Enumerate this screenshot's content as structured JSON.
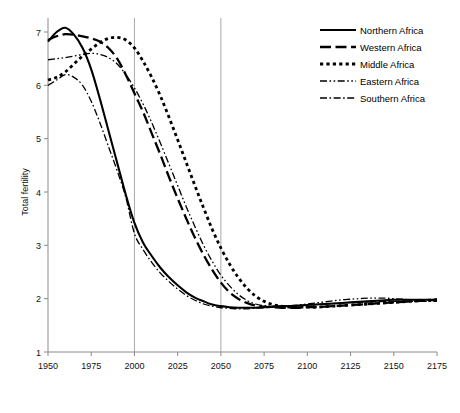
{
  "chart_data": {
    "type": "line",
    "title": "",
    "xlabel": "",
    "ylabel": "Total fertility",
    "xlim": [
      1950,
      2175
    ],
    "ylim": [
      1,
      7
    ],
    "grid": "vertical-at-2000-and-2050",
    "legend_position": "top-right",
    "xticks": [
      1950,
      1975,
      2000,
      2025,
      2050,
      2075,
      2100,
      2125,
      2150,
      2175
    ],
    "yticks": [
      1,
      2,
      3,
      4,
      5,
      6,
      7
    ],
    "gridlines_x": [
      2000,
      2050
    ],
    "x": [
      1950,
      1955,
      1960,
      1965,
      1970,
      1975,
      1980,
      1985,
      1990,
      1995,
      2000,
      2005,
      2010,
      2015,
      2020,
      2025,
      2030,
      2035,
      2040,
      2045,
      2050,
      2055,
      2060,
      2065,
      2070,
      2075,
      2080,
      2085,
      2090,
      2095,
      2100,
      2105,
      2110,
      2115,
      2120,
      2125,
      2130,
      2135,
      2140,
      2145,
      2150,
      2155,
      2160,
      2165,
      2170,
      2175
    ],
    "series": [
      {
        "name": "Northern Africa",
        "style": "solid",
        "values": [
          6.82,
          7.0,
          7.08,
          6.95,
          6.7,
          6.3,
          5.75,
          5.15,
          4.55,
          3.95,
          3.42,
          3.05,
          2.8,
          2.58,
          2.4,
          2.25,
          2.12,
          2.02,
          1.95,
          1.89,
          1.86,
          1.84,
          1.83,
          1.83,
          1.83,
          1.84,
          1.85,
          1.86,
          1.86,
          1.87,
          1.88,
          1.89,
          1.9,
          1.91,
          1.92,
          1.93,
          1.94,
          1.95,
          1.96,
          1.97,
          1.98,
          1.98,
          1.98,
          1.98,
          1.98,
          1.98
        ]
      },
      {
        "name": "Western Africa",
        "style": "long-dash",
        "values": [
          6.85,
          6.92,
          6.96,
          6.95,
          6.92,
          6.88,
          6.82,
          6.7,
          6.5,
          6.2,
          5.85,
          5.5,
          5.1,
          4.7,
          4.28,
          3.88,
          3.5,
          3.14,
          2.82,
          2.54,
          2.3,
          2.12,
          2.0,
          1.92,
          1.87,
          1.85,
          1.84,
          1.83,
          1.83,
          1.83,
          1.84,
          1.84,
          1.85,
          1.86,
          1.87,
          1.88,
          1.89,
          1.9,
          1.91,
          1.92,
          1.93,
          1.94,
          1.95,
          1.96,
          1.97,
          1.98
        ]
      },
      {
        "name": "Middle Africa",
        "style": "dotted",
        "values": [
          6.1,
          6.15,
          6.25,
          6.4,
          6.55,
          6.68,
          6.8,
          6.88,
          6.9,
          6.85,
          6.7,
          6.45,
          6.15,
          5.8,
          5.4,
          4.98,
          4.55,
          4.12,
          3.7,
          3.3,
          2.95,
          2.65,
          2.4,
          2.2,
          2.05,
          1.95,
          1.89,
          1.86,
          1.84,
          1.84,
          1.84,
          1.84,
          1.85,
          1.86,
          1.87,
          1.88,
          1.89,
          1.9,
          1.91,
          1.92,
          1.93,
          1.94,
          1.95,
          1.96,
          1.97,
          1.98
        ]
      },
      {
        "name": "Eastern Africa",
        "style": "dash-dot-dot",
        "values": [
          6.48,
          6.5,
          6.52,
          6.55,
          6.58,
          6.6,
          6.58,
          6.52,
          6.4,
          6.2,
          5.95,
          5.65,
          5.3,
          4.92,
          4.52,
          4.12,
          3.72,
          3.35,
          3.0,
          2.7,
          2.44,
          2.24,
          2.08,
          1.97,
          1.9,
          1.87,
          1.86,
          1.86,
          1.87,
          1.88,
          1.9,
          1.92,
          1.94,
          1.96,
          1.98,
          1.99,
          2.0,
          2.01,
          2.01,
          2.01,
          2.0,
          1.99,
          1.98,
          1.98,
          1.97,
          1.97
        ]
      },
      {
        "name": "Southern Africa",
        "style": "dash-dot",
        "values": [
          6.0,
          6.1,
          6.2,
          6.15,
          6.0,
          5.7,
          5.3,
          4.85,
          4.4,
          3.9,
          3.22,
          2.92,
          2.68,
          2.48,
          2.32,
          2.18,
          2.06,
          1.97,
          1.9,
          1.86,
          1.83,
          1.82,
          1.81,
          1.81,
          1.82,
          1.83,
          1.84,
          1.85,
          1.86,
          1.87,
          1.88,
          1.89,
          1.9,
          1.91,
          1.92,
          1.93,
          1.93,
          1.94,
          1.94,
          1.95,
          1.95,
          1.95,
          1.95,
          1.95,
          1.95,
          1.95
        ]
      }
    ]
  },
  "legend": {
    "items": [
      {
        "label": "Northern Africa"
      },
      {
        "label": "Western Africa"
      },
      {
        "label": "Middle Africa"
      },
      {
        "label": "Eastern Africa"
      },
      {
        "label": "Southern Africa"
      }
    ]
  }
}
